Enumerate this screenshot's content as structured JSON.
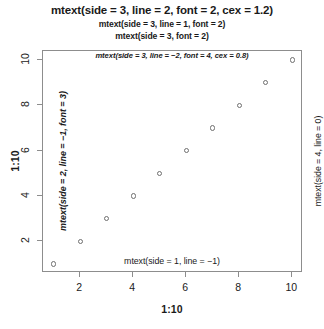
{
  "titles": {
    "main": "mtext(side = 3, line = 2, font = 2, cex = 1.2)",
    "sub1": "mtext(side = 3, line = 1, font = 2)",
    "sub2": "mtext(side = 3, font = 2)"
  },
  "annotations": {
    "inner_top": "mtext(side = 3, line = −2, font = 4, cex = 0.8)",
    "inner_bottom": "mtext(side = 1, line = −1)",
    "inner_left": "mtext(side = 2, line = −1, font = 3)",
    "outer_right": "mtext(side = 4, line = 0)"
  },
  "axes": {
    "x_title": "1:10",
    "y_title": "1:10"
  },
  "colors": {
    "box": "#8d8d8d",
    "point": "#6f6f6f",
    "text": "#1a1a1a",
    "background": "#ffffff"
  },
  "chart_data": {
    "type": "scatter",
    "title": "mtext(side = 3, line = 2, font = 2, cex = 1.2)",
    "xlabel": "1:10",
    "ylabel": "1:10",
    "x": [
      1,
      2,
      3,
      4,
      5,
      6,
      7,
      8,
      9,
      10
    ],
    "y": [
      1,
      2,
      3,
      4,
      5,
      6,
      7,
      8,
      9,
      10
    ],
    "xlim": [
      0.595,
      10.405
    ],
    "ylim": [
      0.595,
      10.405
    ],
    "x_ticks": [
      2,
      4,
      6,
      8,
      10
    ],
    "y_ticks": [
      2,
      4,
      6,
      8,
      10
    ],
    "x_ticklabels": [
      "2",
      "4",
      "6",
      "8",
      "10"
    ],
    "y_ticklabels": [
      "2",
      "4",
      "6",
      "8",
      "10"
    ],
    "grid": false,
    "legend": null,
    "marker": "open-circle",
    "series": [
      {
        "name": "1:10",
        "values": [
          1,
          2,
          3,
          4,
          5,
          6,
          7,
          8,
          9,
          10
        ]
      }
    ],
    "annotations": [
      {
        "side": 3,
        "line": 2,
        "text": "mtext(side = 3, line = 2, font = 2, cex = 1.2)"
      },
      {
        "side": 3,
        "line": 1,
        "text": "mtext(side = 3, line = 1, font = 2)"
      },
      {
        "side": 3,
        "line": 0,
        "text": "mtext(side = 3, font = 2)"
      },
      {
        "side": 3,
        "line": -2,
        "text": "mtext(side = 3, line = −2, font = 4, cex = 0.8)"
      },
      {
        "side": 1,
        "line": -1,
        "text": "mtext(side = 1, line = −1)"
      },
      {
        "side": 2,
        "line": -1,
        "text": "mtext(side = 2, line = −1, font = 3)"
      },
      {
        "side": 4,
        "line": 0,
        "text": "mtext(side = 4, line = 0)"
      }
    ]
  }
}
